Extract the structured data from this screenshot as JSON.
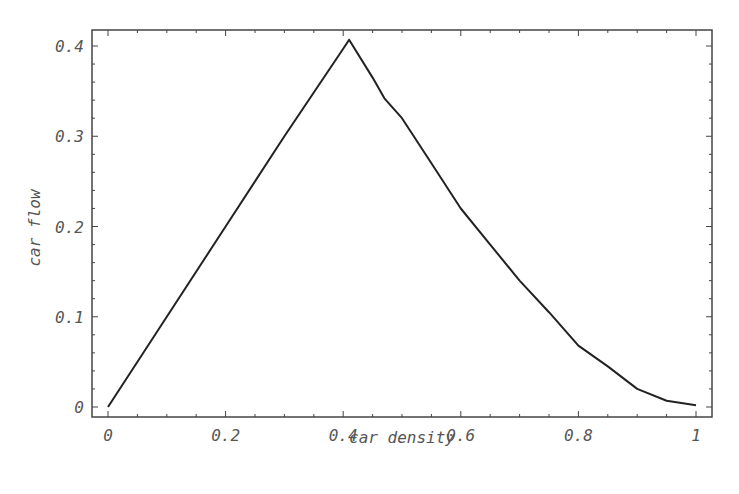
{
  "chart_data": {
    "type": "line",
    "title": "",
    "xlabel": "car density",
    "ylabel": "car flow",
    "xlim": [
      0,
      1
    ],
    "ylim": [
      0,
      0.4
    ],
    "grid": false,
    "legend": null,
    "x_ticks": [
      "0",
      "0.2",
      "0.4",
      "0.6",
      "0.8",
      "1"
    ],
    "y_ticks": [
      "0",
      "0.1",
      "0.2",
      "0.3",
      "0.4"
    ],
    "series": [
      {
        "name": "car flow",
        "x": [
          0,
          0.1,
          0.2,
          0.3,
          0.4,
          0.41,
          0.45,
          0.47,
          0.5,
          0.55,
          0.6,
          0.65,
          0.7,
          0.75,
          0.8,
          0.85,
          0.9,
          0.95,
          1.0
        ],
        "y": [
          0,
          0.1,
          0.2,
          0.3,
          0.397,
          0.407,
          0.365,
          0.342,
          0.32,
          0.27,
          0.22,
          0.18,
          0.14,
          0.105,
          0.068,
          0.045,
          0.02,
          0.007,
          0.002
        ]
      }
    ],
    "colors": {
      "line": "#222222",
      "axis": "#444444",
      "text": "#555555"
    }
  }
}
